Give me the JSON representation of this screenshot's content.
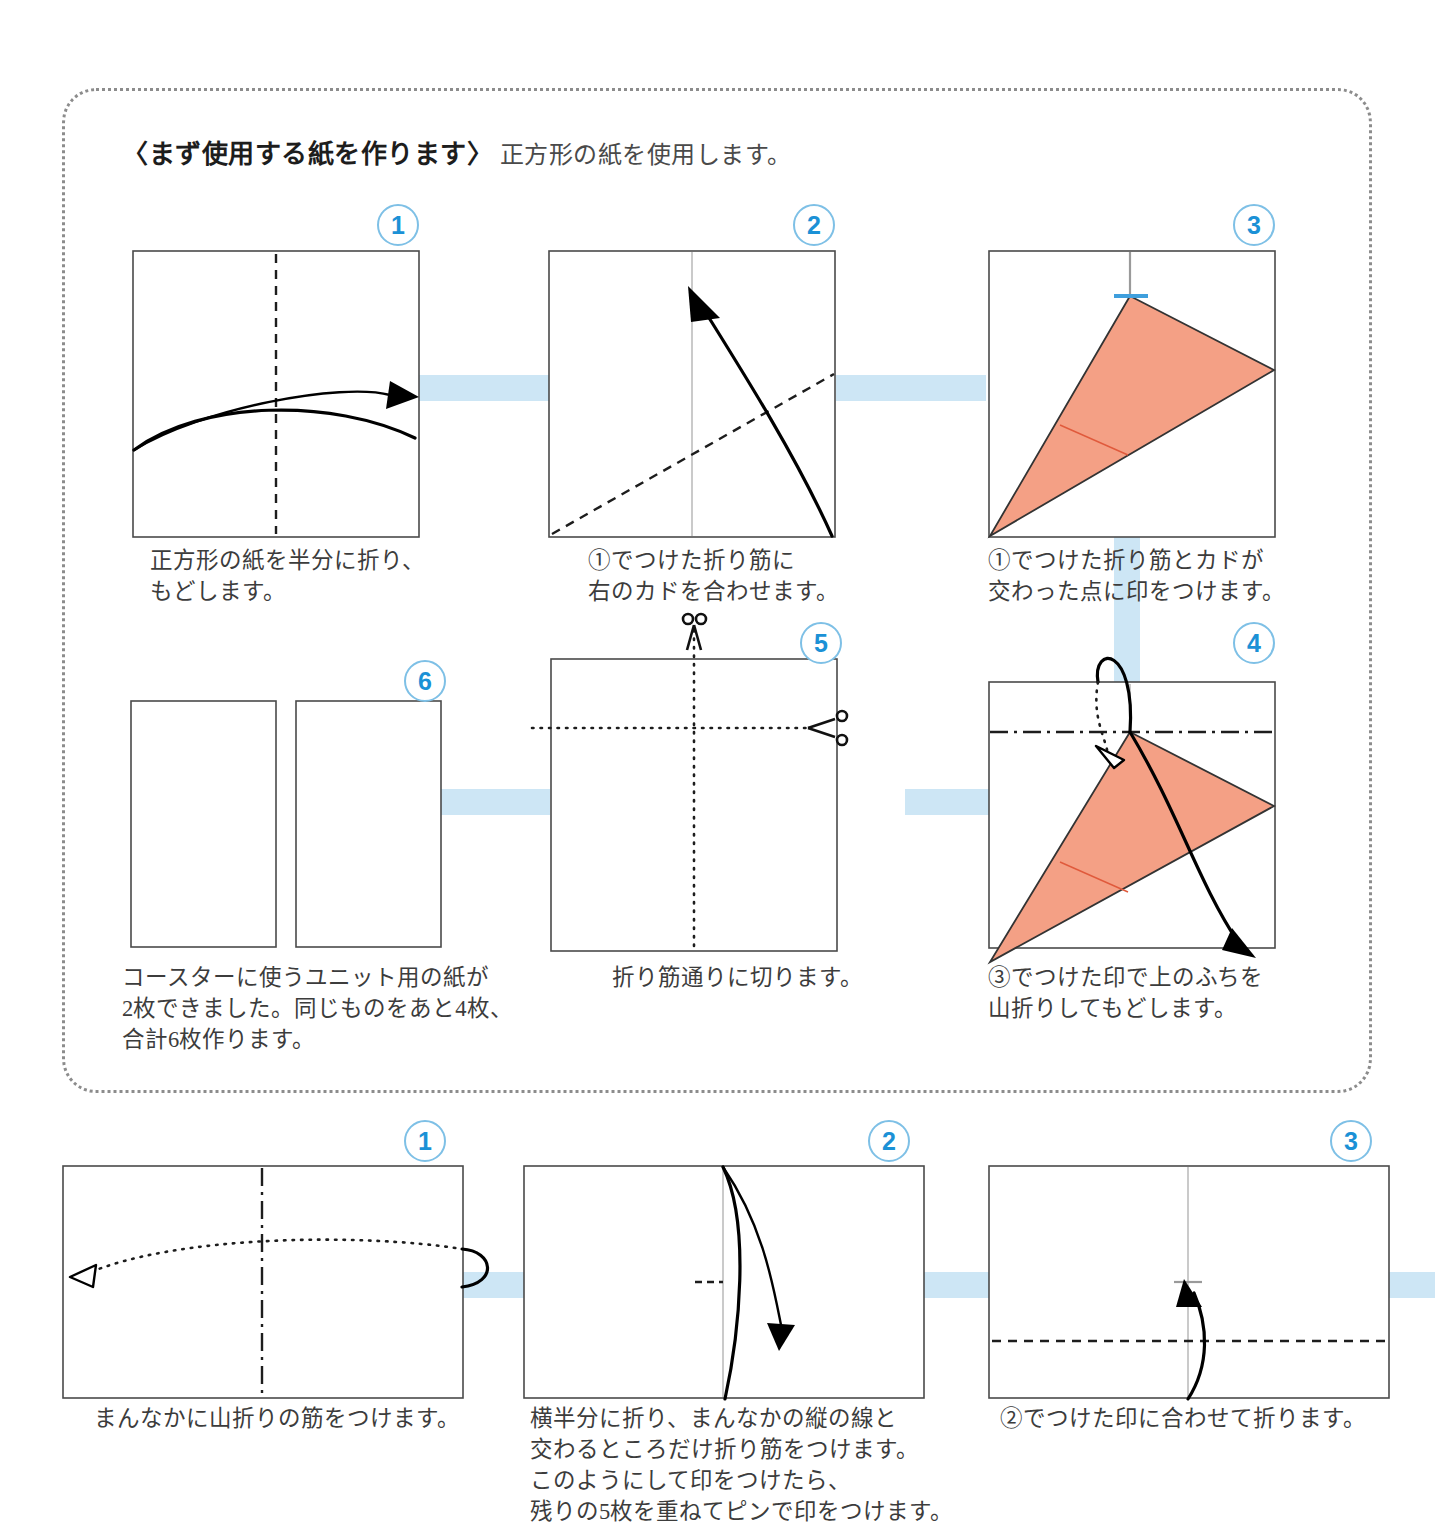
{
  "headline": {
    "bracketed": "〈まず使用する紙を作ります〉",
    "note": "正方形の紙を使用します。"
  },
  "sections": [
    {
      "name": "paper-preparation",
      "steps": [
        {
          "number": "1",
          "caption": "正方形の紙を半分に折り、\nもどします。"
        },
        {
          "number": "2",
          "caption": "①でつけた折り筋に\n右のカドを合わせます。"
        },
        {
          "number": "3",
          "caption": "①でつけた折り筋とカドが\n交わった点に印をつけます。"
        },
        {
          "number": "4",
          "caption": "③でつけた印で上のふちを\n山折りしてもどします。"
        },
        {
          "number": "5",
          "caption": "折り筋通りに切ります。"
        },
        {
          "number": "6",
          "caption": "コースターに使うユニット用の紙が\n2枚できました。同じものをあと4枚、\n合計6枚作ります。"
        }
      ]
    },
    {
      "name": "unit-folding",
      "steps": [
        {
          "number": "1",
          "caption": "まんなかに山折りの筋をつけます。"
        },
        {
          "number": "2",
          "caption": "横半分に折り、まんなかの縦の線と\n交わるところだけ折り筋をつけます。\nこのようにして印をつけたら、\n残りの5枚を重ねてピンで印をつけます。"
        },
        {
          "number": "3",
          "caption": "②でつけた印に合わせて折ります。"
        }
      ]
    }
  ],
  "colors": {
    "badge_blue": "#1b91d6",
    "badge_ring": "#7ec0e6",
    "ribbon_blue": "#cde6f5",
    "paper_fold": "#f4a085",
    "crease_red": "#e05a3c",
    "panel_border": "#8c8c8c"
  },
  "icons": [
    "scissors-icon",
    "valley-fold-arrow-icon",
    "mountain-fold-arrow-icon",
    "unfold-arrow-icon"
  ]
}
